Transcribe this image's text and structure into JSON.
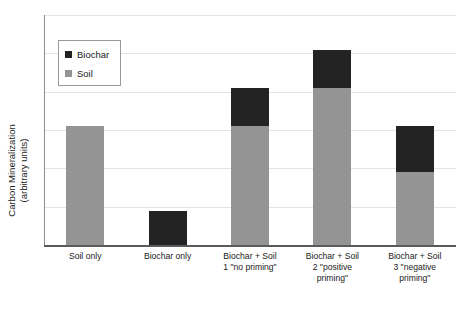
{
  "chart_data": {
    "type": "bar",
    "subtype": "stacked-column",
    "title": "",
    "xlabel": "",
    "ylabel": "Carbon Mineralization (arbitrary units)",
    "ylabel_lines": [
      "Carbon Mineralization",
      "(arbitrary units)"
    ],
    "ylim": [
      0,
      6
    ],
    "grid": true,
    "gridlines": [
      1,
      2,
      3,
      4,
      5,
      6
    ],
    "y_tick_labels": [],
    "legend_position": "upper-left-inside",
    "categories": [
      "Soil only",
      "Biochar only",
      "Biochar + Soil 1 \"no priming\"",
      "Biochar + Soil 2 \"positive priming\"",
      "Biochar + Soil 3 \"negative priming\""
    ],
    "category_label_lines": [
      [
        "Soil only"
      ],
      [
        "Biochar only"
      ],
      [
        "Biochar + Soil",
        "1 \"no priming\""
      ],
      [
        "Biochar + Soil",
        "2 \"positive",
        "priming\""
      ],
      [
        "Biochar + Soil",
        "3 \"negative",
        "priming\""
      ]
    ],
    "series": [
      {
        "name": "Soil",
        "color": "#949494",
        "values": [
          3.1,
          0.0,
          3.1,
          4.1,
          1.9
        ]
      },
      {
        "name": "Biochar",
        "color": "#232323",
        "values": [
          0.0,
          0.9,
          1.0,
          1.0,
          1.2
        ]
      }
    ],
    "totals": [
      3.1,
      0.9,
      4.1,
      5.1,
      3.1
    ],
    "legend_entries": [
      {
        "label": "Biochar",
        "color": "#232323"
      },
      {
        "label": "Soil",
        "color": "#949494"
      }
    ]
  },
  "colors": {
    "biochar": "#232323",
    "soil": "#949494",
    "gridline": "#e4e4e4",
    "axis": "#5a5a5a",
    "background": "#ffffff",
    "text": "#1a1a1a"
  }
}
